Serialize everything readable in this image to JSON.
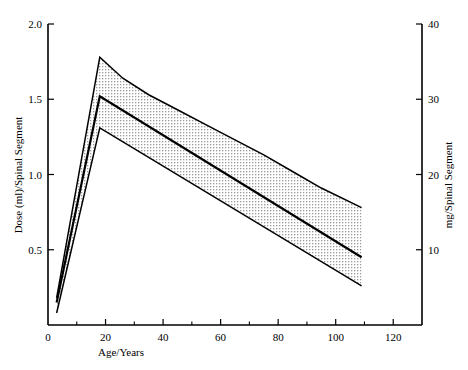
{
  "chart_data": {
    "type": "area",
    "title": "",
    "subtitle": "",
    "xlabel": "Age/Years",
    "ylabel": "Dose (ml)/Spinal Segment",
    "ylabel_right": "mg/Spinal Segment",
    "xlim": [
      0,
      130
    ],
    "ylim": [
      0,
      2.0
    ],
    "ylim_right": [
      0,
      40
    ],
    "grid": false,
    "legend": "none",
    "xticks": [
      0,
      20,
      40,
      60,
      80,
      100,
      120
    ],
    "xtick_labels": [
      "0",
      "20",
      "40",
      "60",
      "80",
      "100",
      "120"
    ],
    "xticks_minor": [
      10,
      30,
      50,
      70,
      90,
      110
    ],
    "yticks": [
      0.5,
      1.0,
      1.5,
      2.0
    ],
    "ytick_labels": [
      "0.5",
      "1.0",
      "1.5",
      "2.0"
    ],
    "yticks_right": [
      10,
      20,
      30,
      40
    ],
    "ytick_labels_right": [
      "10",
      "20",
      "30",
      "40"
    ],
    "series": [
      {
        "name": "upper-bound",
        "x": [
          3,
          18,
          26,
          35,
          45,
          55,
          65,
          75,
          85,
          95,
          109
        ],
        "values": [
          0.18,
          1.78,
          1.64,
          1.53,
          1.43,
          1.33,
          1.23,
          1.13,
          1.02,
          0.91,
          0.78
        ]
      },
      {
        "name": "mean-dose",
        "x": [
          3,
          18,
          109
        ],
        "values": [
          0.15,
          1.52,
          0.45
        ]
      },
      {
        "name": "lower-bound",
        "x": [
          3,
          18,
          109
        ],
        "values": [
          0.08,
          1.31,
          0.26
        ]
      }
    ],
    "band": {
      "name": "dose-range-band",
      "upper": "upper-bound",
      "lower": "lower-bound",
      "fill": "stipple",
      "fill_color": "#d8d8d8"
    },
    "colors": {
      "line": "#000000",
      "axis": "#000000",
      "band": "#d8d8d8",
      "background": "#ffffff"
    }
  }
}
